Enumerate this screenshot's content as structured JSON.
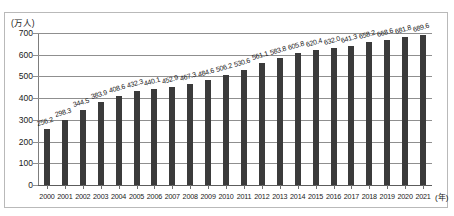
{
  "chart_data": {
    "type": "bar",
    "title": "",
    "subtitle": "",
    "unit_label": "(万人)",
    "xlabel": "(年)",
    "ylabel": "",
    "ylim": [
      0,
      700
    ],
    "ytick_values": [
      0,
      100,
      200,
      300,
      400,
      500,
      600,
      700
    ],
    "ytick_labels": [
      "0",
      "100",
      "200",
      "300",
      "400",
      "500",
      "600",
      "700"
    ],
    "grid": true,
    "legend": null,
    "bar_color": "#3b3b3b",
    "categories": [
      "2000",
      "2001",
      "2002",
      "2003",
      "2004",
      "2005",
      "2006",
      "2007",
      "2008",
      "2009",
      "2010",
      "2011",
      "2012",
      "2013",
      "2014",
      "2015",
      "2016",
      "2017",
      "2018",
      "2019",
      "2020",
      "2021"
    ],
    "values": [
      256.2,
      298.3,
      344.5,
      383.9,
      408.6,
      432.3,
      440.1,
      452.9,
      467.3,
      484.6,
      506.2,
      530.6,
      561.1,
      583.8,
      605.8,
      620.4,
      632.0,
      641.3,
      658.2,
      668.6,
      681.8,
      689.6
    ],
    "value_labels": [
      "256.2",
      "298.3",
      "344.5",
      "383.9",
      "408.6",
      "432.3",
      "440.1",
      "452.9",
      "467.3",
      "484.6",
      "506.2",
      "530.6",
      "561.1",
      "583.8",
      "605.8",
      "620.4",
      "632.0",
      "641.3",
      "658.2",
      "668.6",
      "681.8",
      "689.6"
    ]
  }
}
